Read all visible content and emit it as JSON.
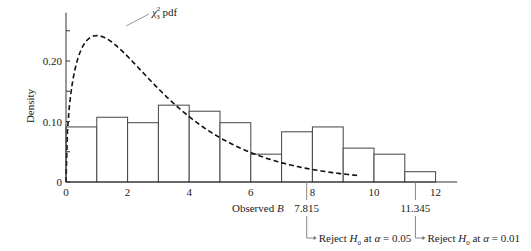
{
  "chart_data": {
    "type": "bar",
    "title": "",
    "xlabel": "Observed B",
    "ylabel": "Density",
    "xlim": [
      0,
      12.7
    ],
    "ylim": [
      0,
      0.28
    ],
    "grid": false,
    "x_ticks": [
      0,
      2,
      4,
      6,
      8,
      10,
      12
    ],
    "x_tick_labels": [
      "0",
      "2",
      "4",
      "6",
      "8",
      "10",
      "12"
    ],
    "y_ticks": [
      0,
      0.1,
      0.2
    ],
    "y_tick_labels": [
      "0",
      "0.10",
      "0.20"
    ],
    "y_minor_ticks": [
      0.05,
      0.15,
      0.25
    ],
    "histogram": {
      "name": "Observed B histogram",
      "bin_edges": [
        0,
        1,
        2,
        3,
        4,
        5,
        6,
        7,
        8,
        9,
        10,
        11,
        12
      ],
      "values": [
        0.091,
        0.107,
        0.098,
        0.127,
        0.117,
        0.098,
        0.046,
        0.083,
        0.091,
        0.056,
        0.046,
        0.017
      ]
    },
    "series": [
      {
        "name": "chi-square pdf, 3 df",
        "type": "line",
        "style": "dashed",
        "df": 3,
        "x_range": [
          0,
          9.5
        ]
      }
    ],
    "curve_label": {
      "main": "χ",
      "sup": "2",
      "sub": "3",
      "suffix": " pdf"
    },
    "critical_values": [
      {
        "value": 7.815,
        "label": "7.815",
        "note_prefix": "Reject ",
        "note_var": "H",
        "note_sub": "0",
        "note_mid": " at ",
        "note_alpha": "α",
        "note_suffix": " = 0.05"
      },
      {
        "value": 11.345,
        "label": "11.345",
        "note_prefix": "Reject ",
        "note_var": "H",
        "note_sub": "0",
        "note_mid": " at ",
        "note_alpha": "α",
        "note_suffix": " = 0.01"
      }
    ]
  }
}
